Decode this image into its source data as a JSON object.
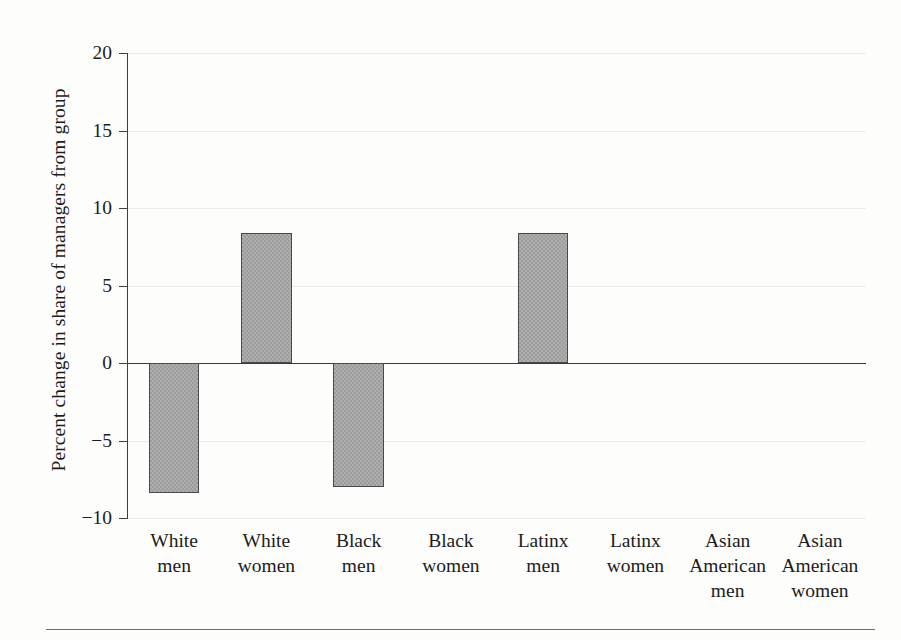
{
  "chart_data": {
    "type": "bar",
    "title": "",
    "xlabel": "",
    "ylabel": "Percent change in share of managers from group",
    "categories": [
      "White men",
      "White women",
      "Black men",
      "Black women",
      "Latinx men",
      "Latinx women",
      "Asian American men",
      "Asian American women"
    ],
    "category_lines": [
      [
        "White",
        "men"
      ],
      [
        "White",
        "women"
      ],
      [
        "Black",
        "men"
      ],
      [
        "Black",
        "women"
      ],
      [
        "Latinx",
        "men"
      ],
      [
        "Latinx",
        "women"
      ],
      [
        "Asian",
        "American",
        "men"
      ],
      [
        "Asian",
        "American",
        "women"
      ]
    ],
    "values": [
      -8.4,
      8.4,
      -8.0,
      0,
      8.4,
      0,
      0,
      0
    ],
    "ylim": [
      -10,
      20
    ],
    "yticks": [
      20,
      15,
      10,
      5,
      0,
      -5,
      -10
    ],
    "ytick_labels": [
      "20",
      "15",
      "10",
      "5",
      "0",
      "−5",
      "−10"
    ],
    "grid": true,
    "legend": "none",
    "bar_color": "#9d9d9d",
    "bar_edge_color": "#4a4a4a",
    "zero_line_color": "#3a3a3a",
    "axis_color": "#3f3f3f",
    "grid_color": "#ececec",
    "background_color": "#fdfdfc"
  },
  "axis": {
    "y_title": "Percent change in share of managers from group"
  }
}
